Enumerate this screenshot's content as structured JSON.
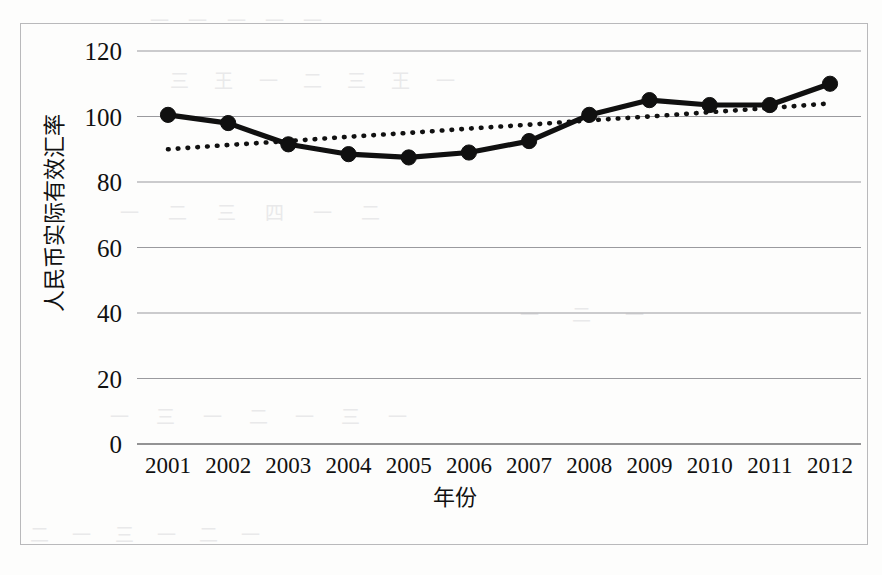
{
  "figure": {
    "background_color": "#fdfdfc",
    "frame_color": "#b9b9bb",
    "series_color": "#101010",
    "grid_color": "#9a9a9e"
  },
  "scan_artifacts": {
    "band_1": "一 一 一 一 一",
    "band_2": "三 王 一 二 三 王 一",
    "band_3": "一 二 三 四 一 二",
    "band_4": "一 三 一 二 一 三 一",
    "band_5": "二 一 三 一 二 一",
    "band_6": "一 二 一"
  },
  "chart_data": {
    "type": "line",
    "title": "",
    "xlabel": "年份",
    "ylabel": "人民币实际有效汇率",
    "categories": [
      "2001",
      "2002",
      "2003",
      "2004",
      "2005",
      "2006",
      "2007",
      "2008",
      "2009",
      "2010",
      "2011",
      "2012"
    ],
    "ylim": [
      0,
      120
    ],
    "yticks": [
      0,
      20,
      40,
      60,
      80,
      100,
      120
    ],
    "ytick_labels": [
      "0",
      "20",
      "40",
      "60",
      "80",
      "100",
      "120"
    ],
    "grid": "horizontal",
    "legend": "none",
    "series": [
      {
        "name": "人民币实际有效汇率",
        "style": "solid-with-markers",
        "marker": "circle",
        "values": [
          100.5,
          98.0,
          91.5,
          88.5,
          87.5,
          89.0,
          92.5,
          100.5,
          105.0,
          103.5,
          103.5,
          110.0
        ]
      },
      {
        "name": "趋势线",
        "style": "dotted-trendline",
        "marker": "none",
        "values": [
          90.0,
          91.3,
          92.5,
          93.8,
          95.0,
          96.3,
          97.5,
          98.8,
          100.0,
          101.3,
          102.6,
          104.0
        ]
      }
    ]
  }
}
